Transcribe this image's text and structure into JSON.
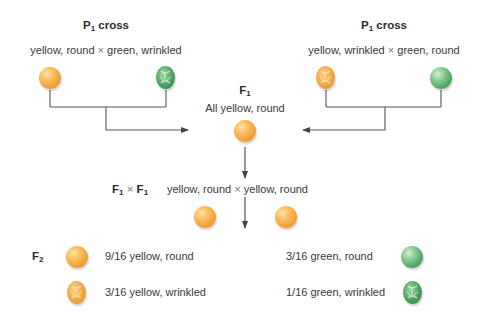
{
  "colors": {
    "yellow_pea": "#f3a23a",
    "green_pea": "#54a766",
    "line": "#555555",
    "text": "#3a3a3a"
  },
  "p1_left": {
    "title": "P",
    "title_sub": "1",
    "title_suffix": " cross",
    "cross_left": "yellow, round",
    "cross_symbol": "×",
    "cross_right": "green, wrinkled",
    "peas": [
      {
        "color": "yellow",
        "shape": "round"
      },
      {
        "color": "green",
        "shape": "wrinkled"
      }
    ]
  },
  "p1_right": {
    "title": "P",
    "title_sub": "1",
    "title_suffix": " cross",
    "cross_left": "yellow, wrinkled",
    "cross_symbol": "×",
    "cross_right": "green, round",
    "peas": [
      {
        "color": "yellow",
        "shape": "wrinkled"
      },
      {
        "color": "green",
        "shape": "round"
      }
    ]
  },
  "f1": {
    "label": "F",
    "label_sub": "1",
    "description": "All yellow, round",
    "pea": {
      "color": "yellow",
      "shape": "round"
    }
  },
  "f1_cross": {
    "label_a": "F",
    "label_a_sub": "1",
    "symbol": "×",
    "label_b": "F",
    "label_b_sub": "1",
    "cross_left": "yellow, round",
    "cross_symbol": "×",
    "cross_right": "yellow, round"
  },
  "f2": {
    "label": "F",
    "label_sub": "2",
    "results": [
      {
        "ratio": "9/16",
        "phenotype": "yellow, round",
        "text": "9/16 yellow, round",
        "color": "yellow",
        "shape": "round"
      },
      {
        "ratio": "3/16",
        "phenotype": "yellow, wrinkled",
        "text": "3/16 yellow, wrinkled",
        "color": "yellow",
        "shape": "wrinkled"
      },
      {
        "ratio": "3/16",
        "phenotype": "green, round",
        "text": "3/16 green, round",
        "color": "green",
        "shape": "round"
      },
      {
        "ratio": "1/16",
        "phenotype": "green, wrinkled",
        "text": "1/16 green, wrinkled",
        "color": "green",
        "shape": "wrinkled"
      }
    ]
  }
}
